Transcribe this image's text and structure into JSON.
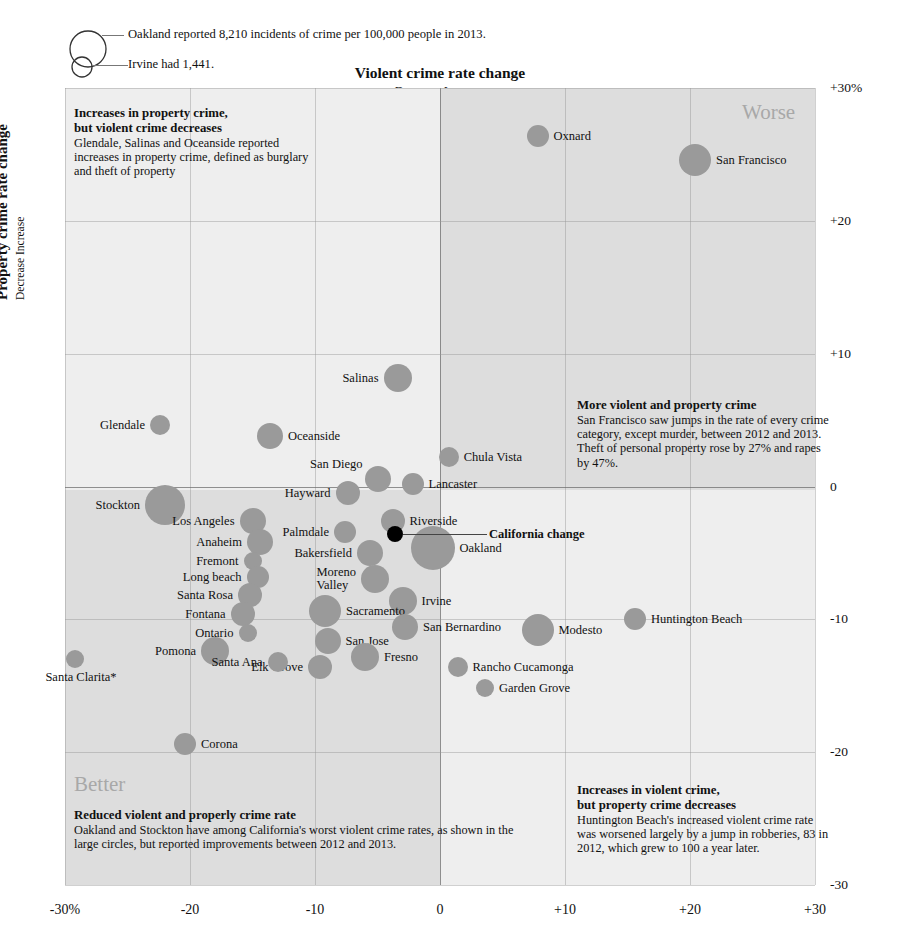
{
  "chart_data": {
    "type": "scatter",
    "title": "Violent crime rate change",
    "subtitle": "Decrease  Increase",
    "xlabel": "Violent crime rate change",
    "ylabel": "Property crime rate change",
    "ylabel_sub": "Decrease  Increase",
    "xlim": [
      -30,
      30
    ],
    "ylim": [
      -30,
      30
    ],
    "grid": true,
    "xticks": [
      "-30%",
      "-20",
      "-10",
      "0",
      "+10",
      "+20",
      "+30"
    ],
    "xtick_values": [
      -30,
      -20,
      -10,
      0,
      10,
      20,
      30
    ],
    "yticks": [
      "+30%",
      "+20",
      "+10",
      "0",
      "-10",
      "-20",
      "-30"
    ],
    "ytick_values": [
      30,
      20,
      10,
      0,
      -10,
      -20,
      -30
    ],
    "size_meaning": "bubble area = incidents of crime per 100,000 people in 2013",
    "points": [
      {
        "name": "Oxnard",
        "x": 7.8,
        "y": 26.4,
        "r": 11,
        "lab": "l"
      },
      {
        "name": "San Francisco",
        "x": 20.4,
        "y": 24.6,
        "r": 16,
        "lab": "l"
      },
      {
        "name": "Salinas",
        "x": -3.4,
        "y": 8.2,
        "r": 14,
        "lab": "r"
      },
      {
        "name": "Glendale",
        "x": -22.4,
        "y": 4.6,
        "r": 10,
        "lab": "r"
      },
      {
        "name": "Oceanside",
        "x": -13.6,
        "y": 3.8,
        "r": 13,
        "lab": "l"
      },
      {
        "name": "Chula Vista",
        "x": 0.7,
        "y": 2.2,
        "r": 10,
        "lab": "l"
      },
      {
        "name": "San Diego",
        "x": -5.0,
        "y": 0.6,
        "r": 13,
        "lab": "rt"
      },
      {
        "name": "Lancaster",
        "x": -2.2,
        "y": 0.2,
        "r": 11,
        "lab": "l"
      },
      {
        "name": "Hayward",
        "x": -7.4,
        "y": -0.5,
        "r": 12,
        "lab": "r"
      },
      {
        "name": "Stockton",
        "x": -22.0,
        "y": -1.4,
        "r": 20,
        "lab": "r"
      },
      {
        "name": "Los Angeles",
        "x": -15.0,
        "y": -2.6,
        "r": 13,
        "lab": "r"
      },
      {
        "name": "Riverside",
        "x": -3.8,
        "y": -2.6,
        "r": 12,
        "lab": "l"
      },
      {
        "name": "Palmdale",
        "x": -7.6,
        "y": -3.4,
        "r": 11,
        "lab": "r"
      },
      {
        "name": "Anaheim",
        "x": -14.4,
        "y": -4.2,
        "r": 13,
        "lab": "r"
      },
      {
        "name": "Bakersfield",
        "x": -5.6,
        "y": -5.0,
        "r": 13,
        "lab": "r"
      },
      {
        "name": "Oakland",
        "x": -0.6,
        "y": -4.6,
        "r": 22,
        "lab": "l"
      },
      {
        "name": "Fremont",
        "x": -15.0,
        "y": -5.6,
        "r": 9,
        "lab": "r"
      },
      {
        "name": "Long beach",
        "x": -14.6,
        "y": -6.8,
        "r": 11,
        "lab": "r"
      },
      {
        "name": "Moreno Valley",
        "x": -5.2,
        "y": -7.0,
        "r": 14,
        "lab": "r"
      },
      {
        "name": "Santa Rosa",
        "x": -15.2,
        "y": -8.2,
        "r": 12,
        "lab": "r"
      },
      {
        "name": "Irvine",
        "x": -3.0,
        "y": -8.6,
        "r": 14,
        "lab": "l"
      },
      {
        "name": "Fontana",
        "x": -15.8,
        "y": -9.6,
        "r": 12,
        "lab": "r"
      },
      {
        "name": "Sacramento",
        "x": -9.2,
        "y": -9.4,
        "r": 16,
        "lab": "l"
      },
      {
        "name": "Huntington Beach",
        "x": 15.6,
        "y": -10.0,
        "r": 11,
        "lab": "l"
      },
      {
        "name": "Modesto",
        "x": 7.8,
        "y": -10.8,
        "r": 16,
        "lab": "l"
      },
      {
        "name": "San Bernardino",
        "x": -2.8,
        "y": -10.6,
        "r": 13,
        "lab": "l"
      },
      {
        "name": "Ontario",
        "x": -15.4,
        "y": -11.0,
        "r": 9,
        "lab": "r"
      },
      {
        "name": "San Jose",
        "x": -9.0,
        "y": -11.6,
        "r": 13,
        "lab": "l"
      },
      {
        "name": "Pomona",
        "x": -18.0,
        "y": -12.4,
        "r": 14,
        "lab": "r"
      },
      {
        "name": "Fresno",
        "x": -6.0,
        "y": -12.8,
        "r": 14,
        "lab": "l"
      },
      {
        "name": "Elk Grove",
        "x": -9.6,
        "y": -13.6,
        "r": 12,
        "lab": "r"
      },
      {
        "name": "Santa Ana",
        "x": -13.0,
        "y": -13.2,
        "r": 10,
        "lab": "r"
      },
      {
        "name": "Rancho Cucamonga",
        "x": 1.4,
        "y": -13.6,
        "r": 10,
        "lab": "l"
      },
      {
        "name": "Garden Grove",
        "x": 3.6,
        "y": -15.2,
        "r": 9,
        "lab": "l"
      },
      {
        "name": "Santa Clarita*",
        "x": -29.2,
        "y": -13.0,
        "r": 9,
        "lab": "b"
      },
      {
        "name": "Corona",
        "x": -20.4,
        "y": -19.4,
        "r": 11,
        "lab": "l"
      },
      {
        "name": "California change",
        "x": -3.6,
        "y": -3.6,
        "r": 8,
        "lab": "callout",
        "highlight": true
      }
    ]
  },
  "legend": {
    "line1": "Oakland reported 8,210 incidents of crime per 100,000 people in 2013.",
    "line2": "Irvine had 1,441."
  },
  "annotations": {
    "top_left": {
      "heading_line1": "Increases in property crime,",
      "heading_line2": "but violent crime decreases",
      "body": "Glendale, Salinas and Oceanside reported increases in property crime, defined as burglary and theft of property"
    },
    "mid_right": {
      "heading_line1": "More violent and property crime",
      "body": "San Francisco saw jumps in the rate of every crime category, except murder, between 2012 and 2013. Theft of personal property rose by 27% and rapes by 47%."
    },
    "bottom_left": {
      "corner": "Better",
      "heading_line1": "Reduced violent and properly crime rate",
      "body": "Oakland and Stockton have among California's worst violent crime rates, as shown in the large circles, but reported improvements between 2012 and 2013."
    },
    "bottom_right": {
      "heading_line1": "Increases in violent crime,",
      "heading_line2": "but property crime decreases",
      "body": "Huntington Beach's increased violent crime rate was worsened largely by a jump in robberies, 83 in 2012, which grew to 100 a year later."
    },
    "top_right_corner": "Worse"
  },
  "colors": {
    "bubble": "#9a9a9a",
    "highlight": "#000000",
    "quad_light": "#eeeeee",
    "quad_dark": "#dddddd",
    "corner_text": "#a8a8a8"
  }
}
